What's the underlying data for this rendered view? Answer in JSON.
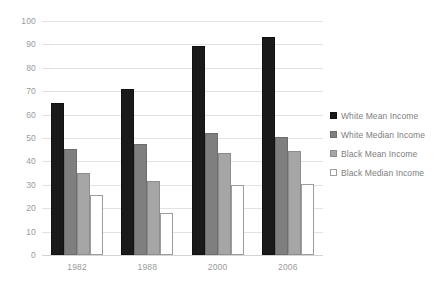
{
  "chart_data": {
    "type": "bar",
    "title": "",
    "subtitle": "",
    "xlabel": "",
    "ylabel": "",
    "categories": [
      "1982",
      "1988",
      "2000",
      "2006"
    ],
    "series": [
      {
        "name": "White Mean Income",
        "values": [
          65,
          71,
          89.5,
          93
        ],
        "color": "#1a1a1a"
      },
      {
        "name": "White Median Income",
        "values": [
          45.5,
          47.5,
          52,
          50.5
        ],
        "color": "#7f7f7f"
      },
      {
        "name": "Black Mean Income",
        "values": [
          35,
          31.5,
          43.5,
          44.5
        ],
        "color": "#a6a6a6"
      },
      {
        "name": "Black Median Income",
        "values": [
          25.5,
          18,
          30,
          30.5
        ],
        "color": "#ffffff"
      }
    ],
    "ylim": [
      0,
      100
    ],
    "yticks": [
      0,
      10,
      20,
      30,
      40,
      50,
      60,
      70,
      80,
      90,
      100
    ],
    "ytick_labels": [
      "0",
      "10",
      "20",
      "30",
      "40",
      "50",
      "60",
      "70",
      "80",
      "90",
      "100"
    ],
    "grid": true,
    "legend_position": "right",
    "axis_text_color": "#9a9a9a",
    "legend_text_color": "#7d7d7d",
    "gridline_color": "#e2e2e2",
    "background_color": "#ffffff"
  }
}
